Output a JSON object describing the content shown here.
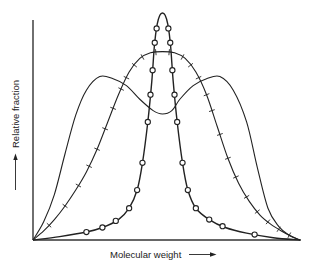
{
  "chart_data": {
    "type": "line",
    "title": "",
    "xlabel": "Molecular weight",
    "ylabel": "Relative fraction",
    "xlabel_arrow": "right-arrow",
    "ylabel_arrow": "up-arrow",
    "xlim": [
      0,
      100
    ],
    "ylim": [
      0,
      100
    ],
    "grid": false,
    "ticks": false,
    "legend": "none",
    "series": [
      {
        "name": "broad-distribution",
        "marker": "none",
        "x": [
          0,
          4,
          8,
          12,
          16,
          20,
          25,
          30,
          35,
          40,
          45,
          48.5,
          52,
          55,
          60,
          65,
          70,
          75,
          80,
          84,
          88,
          92,
          96,
          100
        ],
        "y": [
          0,
          8,
          20,
          38,
          55,
          66,
          72,
          71,
          68,
          62,
          57,
          55.5,
          57,
          62,
          68,
          71,
          72,
          66,
          52,
          32,
          14,
          6,
          2,
          0
        ]
      },
      {
        "name": "intermediate-distribution",
        "marker": "cross",
        "x": [
          0,
          4,
          8,
          12,
          16,
          20,
          24,
          28,
          32,
          36,
          40,
          44,
          48.5,
          53,
          57,
          61,
          65,
          69,
          73,
          77,
          81,
          85,
          89,
          93,
          97,
          100
        ],
        "y": [
          0,
          4,
          9,
          15,
          22,
          30,
          40,
          52,
          64,
          74,
          80,
          82.5,
          83,
          82.5,
          80,
          74,
          64,
          50,
          36,
          25,
          17,
          11,
          7,
          4,
          1.5,
          0
        ],
        "marker_x": [
          6,
          12,
          17,
          21,
          24,
          27,
          30,
          33,
          35,
          38,
          41,
          46,
          51,
          56,
          59,
          62,
          65,
          67,
          70,
          73,
          76,
          80,
          84,
          88,
          92,
          96
        ]
      },
      {
        "name": "narrow-distribution",
        "marker": "circle",
        "x": [
          0,
          10,
          20,
          26,
          32,
          36,
          39,
          41,
          43,
          44.5,
          45.5,
          46.5,
          47.5,
          48.5,
          49.5,
          50.5,
          51.5,
          52.5,
          54,
          56,
          58,
          61,
          66,
          72,
          80,
          90,
          100
        ],
        "y": [
          0,
          1.5,
          3.5,
          5.5,
          9,
          14,
          22,
          34,
          52,
          70,
          86,
          95,
          99,
          100,
          99,
          95,
          86,
          70,
          52,
          34,
          22,
          14,
          9,
          5.5,
          3,
          1,
          0
        ],
        "marker_x": [
          20,
          26,
          31,
          36,
          39,
          41,
          43,
          44,
          44.8,
          45.6,
          46.3,
          50.7,
          51.4,
          52.2,
          53,
          54,
          56,
          58,
          61,
          66,
          71,
          83
        ]
      }
    ]
  }
}
